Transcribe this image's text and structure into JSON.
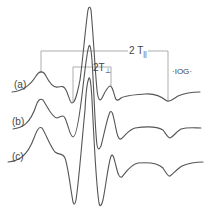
{
  "figure": {
    "type": "EPR derivative spectra",
    "traces": [
      {
        "label": "(a)"
      },
      {
        "label": "(b)"
      },
      {
        "label": "(c)"
      }
    ],
    "annotations": {
      "t_parallel": {
        "prefix": "2 T",
        "subscript": "||"
      },
      "t_perp": {
        "prefix": "2T",
        "subscript": "⊥"
      },
      "scale_bar": "·IOG·"
    },
    "colors": {
      "trace": "#555555",
      "bracket": "#8a8a8a",
      "text": "#444444",
      "background": "#ffffff"
    }
  }
}
